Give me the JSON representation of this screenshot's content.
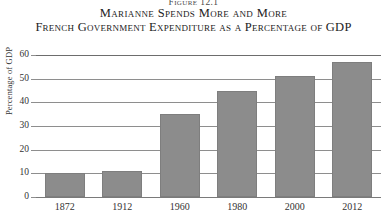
{
  "figure": {
    "number": "Figure 12.1",
    "title": "Marianne Spends More and More",
    "subtitle": "French Government Expenditure as a Percentage of GDP"
  },
  "chart_data": {
    "type": "bar",
    "title": "Marianne Spends More and More",
    "subtitle": "French Government Expenditure as a Percentage of GDP",
    "categories": [
      "1872",
      "1912",
      "1960",
      "1980",
      "2000",
      "2012"
    ],
    "values": [
      10,
      11,
      35,
      45,
      51,
      57
    ],
    "xlabel": "",
    "ylabel": "Percentage of GDP",
    "ylim": [
      0,
      60
    ],
    "yticks": [
      0,
      10,
      20,
      30,
      40,
      50,
      60
    ],
    "ytick_labels": [
      "0",
      "10",
      "20",
      "30",
      "40",
      "50",
      "60"
    ],
    "grid": true,
    "legend": "none",
    "bar_color": "#8c8c8c"
  },
  "colors": {
    "bar": "#8c8c8c",
    "bar_border": "#7e7e7e",
    "gridline": "#8e8e8e",
    "text": "#2b2b2b",
    "background": "#ffffff"
  }
}
